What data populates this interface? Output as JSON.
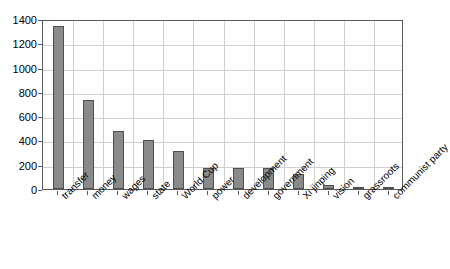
{
  "chart_data": {
    "type": "bar",
    "title": "",
    "xlabel": "",
    "ylabel": "",
    "ylim": [
      0,
      1400
    ],
    "yticks": [
      0,
      200,
      400,
      600,
      800,
      1000,
      1200,
      1400
    ],
    "grid": true,
    "legend": "none",
    "bar_color": "#8a8a8a",
    "bar_edge_color": "#4f4f4f",
    "categories": [
      "transfer",
      "money",
      "wages",
      "state",
      "World Cup",
      "power",
      "development",
      "government",
      "Xi jinping",
      "vision",
      "grassroots",
      "communist party"
    ],
    "values": [
      1345,
      735,
      480,
      400,
      310,
      175,
      175,
      175,
      120,
      35,
      15,
      10
    ]
  }
}
